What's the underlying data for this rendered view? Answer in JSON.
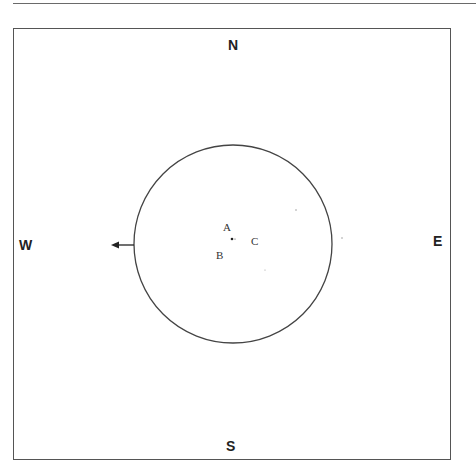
{
  "compass": {
    "north": "N",
    "south": "S",
    "east": "E",
    "west": "W"
  },
  "points": {
    "a": "A",
    "b": "B",
    "c": "C"
  },
  "circle": {
    "cx": 233,
    "cy": 244,
    "r": 99
  },
  "arrow": {
    "direction": "west",
    "from_x": 134,
    "to_x": 111,
    "y": 245
  },
  "colors": {
    "line": "#444444",
    "text": "#222222",
    "frame": "#555555"
  }
}
